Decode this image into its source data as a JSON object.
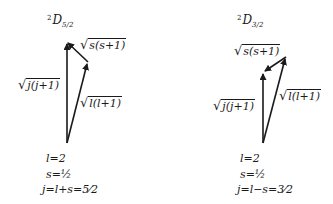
{
  "diagrams": [
    {
      "title": {
        "sup": "2",
        "main": "D",
        "sub": "5/2"
      },
      "vectors": {
        "s": "s(s+1)",
        "j": "j(j+1)",
        "l": "l(l+1)"
      },
      "equations": [
        "l=2",
        "s=½",
        "j=l+s=5⁄2"
      ]
    },
    {
      "title": {
        "sup": "2",
        "main": "D",
        "sub": "3/2"
      },
      "vectors": {
        "s": "s(s+1)",
        "j": "j(j+1)",
        "l": "l(l+1)"
      },
      "equations": [
        "l=2",
        "s=½",
        "j=l−s=3⁄2"
      ]
    }
  ],
  "colors": {
    "ink": "#1a1a1a",
    "background": "#ffffff"
  }
}
